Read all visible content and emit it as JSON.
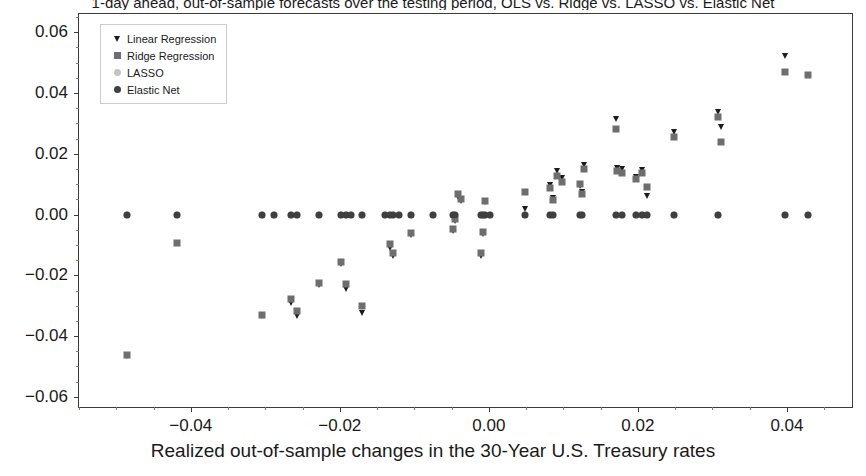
{
  "chart_data": {
    "type": "scatter",
    "title": "1-day ahead, out-of-sample forecasts over the testing period, OLS vs. Ridge vs. LASSO vs. Elastic Net",
    "xlabel": "Realized out-of-sample changes in the 30-Year U.S. Treasury rates",
    "ylabel": "",
    "xlim": [
      -0.055,
      0.049
    ],
    "ylim": [
      -0.064,
      0.066
    ],
    "xticks": [
      -0.04,
      -0.02,
      0.0,
      0.02,
      0.04
    ],
    "xticklabels": [
      "−0.04",
      "−0.02",
      "0.00",
      "0.02",
      "0.04"
    ],
    "yticks": [
      0.06,
      0.04,
      0.02,
      0.0,
      -0.02,
      -0.04,
      -0.06
    ],
    "yticklabels": [
      "0.06",
      "0.04",
      "0.02",
      "0.00",
      "−0.02",
      "−0.04",
      "−0.06"
    ],
    "grid": false,
    "legend_position": "upper left",
    "series": [
      {
        "name": "Linear Regression",
        "marker": "triangle-down",
        "color": "#1c1c1c",
        "size": 7,
        "points": [
          [
            -0.0485,
            -0.0465
          ],
          [
            -0.0305,
            -0.0335
          ],
          [
            -0.0265,
            -0.0292
          ],
          [
            -0.0258,
            -0.0335
          ],
          [
            -0.0228,
            -0.0232
          ],
          [
            -0.0198,
            -0.0162
          ],
          [
            -0.0192,
            -0.0245
          ],
          [
            -0.017,
            -0.0325
          ],
          [
            -0.0132,
            -0.0109
          ],
          [
            -0.0128,
            -0.0137
          ],
          [
            -0.0105,
            -0.0066
          ],
          [
            -0.0048,
            -0.0055
          ],
          [
            -0.0045,
            -0.0022
          ],
          [
            -0.0042,
            0.0059
          ],
          [
            -0.0038,
            0.0046
          ],
          [
            -0.001,
            -0.0135
          ],
          [
            -0.0008,
            -0.0063
          ],
          [
            -0.0005,
            0.004
          ],
          [
            0.0048,
            0.0018
          ],
          [
            0.0082,
            0.0098
          ],
          [
            0.0086,
            0.0055
          ],
          [
            0.0092,
            0.0143
          ],
          [
            0.0098,
            0.012
          ],
          [
            0.0122,
            0.0095
          ],
          [
            0.0125,
            0.0073
          ],
          [
            0.0128,
            0.0164
          ],
          [
            0.017,
            0.0316
          ],
          [
            0.0172,
            0.0154
          ],
          [
            0.0178,
            0.015
          ],
          [
            0.0198,
            0.0124
          ],
          [
            0.0205,
            0.0148
          ],
          [
            0.0212,
            0.0061
          ],
          [
            0.0248,
            0.0272
          ],
          [
            0.0308,
            0.0336
          ],
          [
            0.0312,
            0.0288
          ],
          [
            0.0398,
            0.0522
          ]
        ]
      },
      {
        "name": "Ridge Regression",
        "marker": "square",
        "color": "#6e6e6e",
        "size": 7,
        "points": [
          [
            -0.0485,
            -0.0462
          ],
          [
            -0.0418,
            -0.0095
          ],
          [
            -0.0305,
            -0.033
          ],
          [
            -0.0265,
            -0.0277
          ],
          [
            -0.0258,
            -0.0318
          ],
          [
            -0.0228,
            -0.0226
          ],
          [
            -0.0198,
            -0.0155
          ],
          [
            -0.0192,
            -0.0228
          ],
          [
            -0.017,
            -0.03
          ],
          [
            -0.0132,
            -0.0098
          ],
          [
            -0.0128,
            -0.0126
          ],
          [
            -0.0105,
            -0.006
          ],
          [
            -0.0048,
            -0.0048
          ],
          [
            -0.0045,
            -0.0014
          ],
          [
            -0.0042,
            0.0066
          ],
          [
            -0.0038,
            0.0052
          ],
          [
            -0.001,
            -0.0125
          ],
          [
            -0.0008,
            -0.0056
          ],
          [
            -0.0005,
            0.0046
          ],
          [
            0.0048,
            0.0075
          ],
          [
            0.0082,
            0.0088
          ],
          [
            0.0086,
            0.0048
          ],
          [
            0.0092,
            0.0126
          ],
          [
            0.0098,
            0.0108
          ],
          [
            0.0122,
            0.0102
          ],
          [
            0.0125,
            0.0068
          ],
          [
            0.0128,
            0.015
          ],
          [
            0.017,
            0.0282
          ],
          [
            0.0172,
            0.0144
          ],
          [
            0.0178,
            0.0138
          ],
          [
            0.0198,
            0.0117
          ],
          [
            0.0205,
            0.0138
          ],
          [
            0.0212,
            0.009
          ],
          [
            0.0248,
            0.0256
          ],
          [
            0.0308,
            0.032
          ],
          [
            0.0312,
            0.0238
          ],
          [
            0.0398,
            0.0468
          ],
          [
            0.0428,
            0.046
          ]
        ]
      },
      {
        "name": "LASSO",
        "marker": "circle",
        "color": "#c4c4c4",
        "size": 7,
        "points": [
          [
            -0.0485,
            -0.0002
          ],
          [
            -0.0418,
            -0.0002
          ],
          [
            -0.0305,
            -0.0002
          ],
          [
            -0.0288,
            -0.0002
          ],
          [
            -0.0265,
            -0.0002
          ],
          [
            -0.0258,
            -0.0002
          ],
          [
            -0.0228,
            -0.0002
          ],
          [
            -0.0198,
            -0.0002
          ],
          [
            -0.0192,
            -0.0002
          ],
          [
            -0.0185,
            -0.0002
          ],
          [
            -0.017,
            -0.0002
          ],
          [
            -0.014,
            -0.0002
          ],
          [
            -0.0132,
            -0.0002
          ],
          [
            -0.0128,
            -0.0002
          ],
          [
            -0.012,
            -0.0002
          ],
          [
            -0.0105,
            -0.0002
          ],
          [
            -0.0075,
            -0.0002
          ],
          [
            -0.0048,
            -0.0002
          ],
          [
            -0.0045,
            -0.0002
          ],
          [
            -0.001,
            -0.0002
          ],
          [
            -0.0008,
            -0.0002
          ],
          [
            -0.0005,
            -0.0002
          ],
          [
            0.0002,
            -0.0002
          ],
          [
            0.0048,
            -0.0002
          ],
          [
            0.0082,
            -0.0002
          ],
          [
            0.0086,
            -0.0002
          ],
          [
            0.0122,
            -0.0002
          ],
          [
            0.0125,
            -0.0002
          ],
          [
            0.017,
            -0.0002
          ],
          [
            0.0178,
            -0.0002
          ],
          [
            0.0198,
            -0.0002
          ],
          [
            0.0205,
            -0.0002
          ],
          [
            0.0212,
            -0.0002
          ],
          [
            0.0248,
            -0.0002
          ],
          [
            0.0308,
            -0.0002
          ],
          [
            0.0398,
            -0.0002
          ],
          [
            0.0428,
            -0.0002
          ]
        ]
      },
      {
        "name": "Elastic Net",
        "marker": "circle",
        "color": "#3f3f3f",
        "size": 7,
        "points": [
          [
            -0.0485,
            0.0
          ],
          [
            -0.0418,
            0.0
          ],
          [
            -0.0305,
            0.0
          ],
          [
            -0.0288,
            0.0
          ],
          [
            -0.0265,
            0.0
          ],
          [
            -0.0258,
            0.0
          ],
          [
            -0.0228,
            0.0
          ],
          [
            -0.0198,
            0.0
          ],
          [
            -0.0192,
            0.0
          ],
          [
            -0.0185,
            0.0
          ],
          [
            -0.017,
            0.0
          ],
          [
            -0.014,
            0.0
          ],
          [
            -0.0132,
            0.0
          ],
          [
            -0.0128,
            0.0
          ],
          [
            -0.012,
            0.0
          ],
          [
            -0.0105,
            0.0
          ],
          [
            -0.0075,
            0.0
          ],
          [
            -0.0048,
            0.0
          ],
          [
            -0.0045,
            0.0
          ],
          [
            -0.001,
            0.0
          ],
          [
            -0.0008,
            0.0
          ],
          [
            -0.0005,
            0.0
          ],
          [
            0.0002,
            0.0
          ],
          [
            0.0048,
            0.0
          ],
          [
            0.0082,
            0.0
          ],
          [
            0.0086,
            0.0
          ],
          [
            0.0122,
            0.0
          ],
          [
            0.0125,
            0.0
          ],
          [
            0.017,
            0.0
          ],
          [
            0.0178,
            0.0
          ],
          [
            0.0198,
            0.0
          ],
          [
            0.0205,
            0.0
          ],
          [
            0.0212,
            0.0
          ],
          [
            0.0248,
            0.0
          ],
          [
            0.0308,
            0.0
          ],
          [
            0.0398,
            0.0
          ],
          [
            0.0428,
            0.0
          ]
        ]
      }
    ]
  }
}
